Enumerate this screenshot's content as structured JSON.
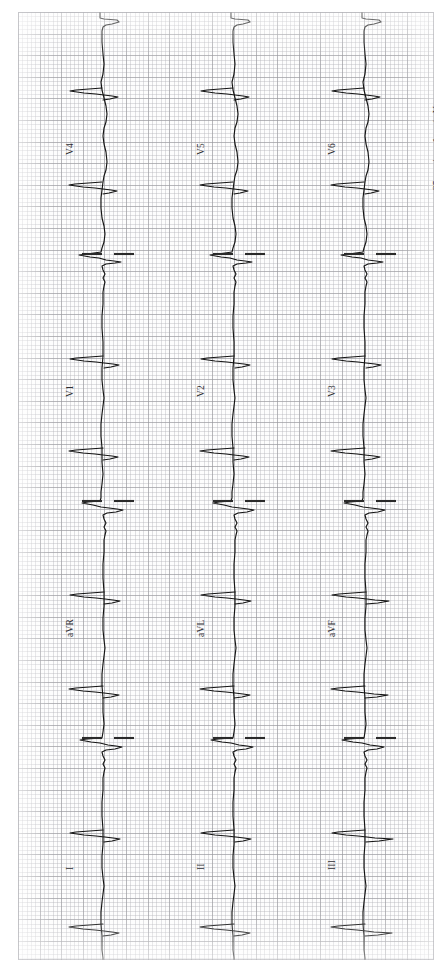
{
  "document": {
    "kind": "12-lead-electrocardiogram-printout",
    "orientation": "rotated-90-counterclockwise",
    "paper_color": "#fdfdfd",
    "grid_major_color": "#96969b",
    "grid_minor_color": "#b2b2b8",
    "trace_color": "#141414"
  },
  "calibration": {
    "text": "25 mm/sec; 1 cm/mV",
    "paper_speed": "25 mm/sec",
    "gain": "1 cm/mV"
  },
  "columns": [
    {
      "index": 0,
      "leads": [
        {
          "name": "V4",
          "label": "V4"
        },
        {
          "name": "V1",
          "label": "V1"
        },
        {
          "name": "aVR",
          "label": "aVR"
        },
        {
          "name": "I",
          "label": "I"
        }
      ]
    },
    {
      "index": 1,
      "leads": [
        {
          "name": "V5",
          "label": "V5"
        },
        {
          "name": "V2",
          "label": "V2"
        },
        {
          "name": "aVL",
          "label": "aVL"
        },
        {
          "name": "II",
          "label": "II"
        }
      ]
    },
    {
      "index": 2,
      "leads": [
        {
          "name": "V6",
          "label": "V6"
        },
        {
          "name": "V3",
          "label": "V3"
        },
        {
          "name": "aVF",
          "label": "aVF"
        },
        {
          "name": "III",
          "label": "III"
        }
      ]
    }
  ],
  "labels": {
    "v4": "V4",
    "v5": "V5",
    "v6": "V6",
    "v1": "V1",
    "v2": "V2",
    "v3": "V3",
    "avr": "aVR",
    "avl": "aVL",
    "avf": "aVF",
    "l1": "I",
    "l2": "II",
    "l3": "III"
  },
  "chart_data": {
    "type": "line",
    "xlabel": "Time",
    "ylabel": "Amplitude (mV)",
    "grid": true,
    "legend_position": "inline-lead-labels",
    "paper_speed_mm_per_s": 25,
    "gain_mm_per_mV": 10,
    "axis_note": "traces run vertically because the sheet is rotated 90 degrees",
    "series": [
      {
        "name": "V4",
        "column": 0,
        "segment": 0
      },
      {
        "name": "V1",
        "column": 0,
        "segment": 1
      },
      {
        "name": "aVR",
        "column": 0,
        "segment": 2
      },
      {
        "name": "I",
        "column": 0,
        "segment": 3
      },
      {
        "name": "V5",
        "column": 1,
        "segment": 0
      },
      {
        "name": "V2",
        "column": 1,
        "segment": 1
      },
      {
        "name": "aVL",
        "column": 1,
        "segment": 2
      },
      {
        "name": "II",
        "column": 1,
        "segment": 3
      },
      {
        "name": "V6",
        "column": 2,
        "segment": 0
      },
      {
        "name": "V3",
        "column": 2,
        "segment": 1
      },
      {
        "name": "aVF",
        "column": 2,
        "segment": 2
      },
      {
        "name": "III",
        "column": 2,
        "segment": 3
      }
    ],
    "lead_separator_positions_y": [
      243,
      490,
      727
    ],
    "column_baseline_x": [
      100,
      231,
      362
    ]
  },
  "label_positions": {
    "v4": {
      "x": 47,
      "y": 143
    },
    "v5": {
      "x": 178,
      "y": 143
    },
    "v6": {
      "x": 309,
      "y": 143
    },
    "v1": {
      "x": 47,
      "y": 385
    },
    "v2": {
      "x": 178,
      "y": 385
    },
    "v3": {
      "x": 309,
      "y": 385
    },
    "avr": {
      "x": 47,
      "y": 625
    },
    "avl": {
      "x": 178,
      "y": 625
    },
    "avf": {
      "x": 309,
      "y": 625
    },
    "l1": {
      "x": 47,
      "y": 858
    },
    "l2": {
      "x": 178,
      "y": 858
    },
    "l3": {
      "x": 309,
      "y": 858
    },
    "cal": {
      "x": 414,
      "y": 178
    }
  }
}
